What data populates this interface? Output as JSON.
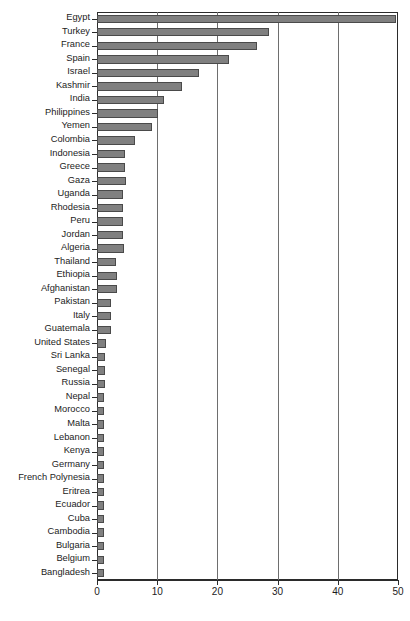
{
  "chart_data": {
    "type": "bar",
    "orientation": "horizontal",
    "title": "",
    "xlabel": "",
    "ylabel": "",
    "xlim": [
      0,
      50
    ],
    "xticks": [
      0,
      10,
      20,
      30,
      40,
      50
    ],
    "grid": true,
    "legend": null,
    "bar_color": "#808080",
    "bar_edge_color": "#4a4a4a",
    "categories": [
      "Egypt",
      "Turkey",
      "France",
      "Spain",
      "Israel",
      "Kashmir",
      "India",
      "Philippines",
      "Yemen",
      "Colombia",
      "Indonesia",
      "Greece",
      "Gaza",
      "Uganda",
      "Rhodesia",
      "Peru",
      "Jordan",
      "Algeria",
      "Thailand",
      "Ethiopia",
      "Afghanistan",
      "Pakistan",
      "Italy",
      "Guatemala",
      "United States",
      "Sri Lanka",
      "Senegal",
      "Russia",
      "Nepal",
      "Morocco",
      "Malta",
      "Lebanon",
      "Kenya",
      "Germany",
      "French Polynesia",
      "Eritrea",
      "Ecuador",
      "Cuba",
      "Cambodia",
      "Bulgaria",
      "Belgium",
      "Bangladesh"
    ],
    "values": [
      49.6,
      28.5,
      26.5,
      21.9,
      16.9,
      14.2,
      11.2,
      10.1,
      9.1,
      6.3,
      4.6,
      4.6,
      4.8,
      4.3,
      4.3,
      4.3,
      4.4,
      4.5,
      3.1,
      3.4,
      3.4,
      2.3,
      2.3,
      2.4,
      1.5,
      1.3,
      1.3,
      1.3,
      1.2,
      1.2,
      1.2,
      1.2,
      1.2,
      1.2,
      1.2,
      1.2,
      1.2,
      1.2,
      1.2,
      1.2,
      1.2,
      1.2
    ]
  },
  "caption": ""
}
